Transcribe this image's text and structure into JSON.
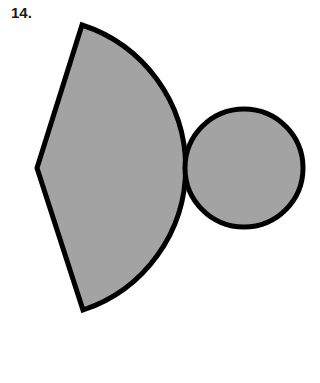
{
  "problem": {
    "number": "14."
  },
  "figure": {
    "fill_color": "#a3a3a3",
    "stroke_color": "#000000",
    "shapes": [
      {
        "type": "sector",
        "apex": [
          37,
          168
        ],
        "arc_start": [
          82,
          25
        ],
        "arc_end": [
          83,
          310
        ],
        "radius": 150
      },
      {
        "type": "circle",
        "center": [
          244,
          168
        ],
        "radius": 60
      }
    ]
  }
}
